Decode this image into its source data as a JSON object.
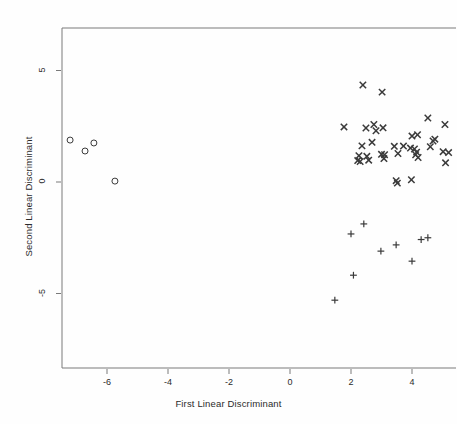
{
  "chart_data": {
    "type": "scatter",
    "title": "",
    "xlabel": "First Linear Discriminant",
    "ylabel": "Second Linear Discriminant",
    "xlim": [
      -7.8,
      5.45
    ],
    "ylim": [
      -7.4,
      6.2
    ],
    "xticks": [
      -6,
      -4,
      -2,
      0,
      2,
      4
    ],
    "xtick_labels": [
      "-6",
      "-4",
      "-2",
      "0",
      "2",
      "4"
    ],
    "yticks": [
      5,
      0,
      -5
    ],
    "ytick_labels": [
      "5",
      "0",
      "-5"
    ],
    "grid": false,
    "legend": "none",
    "marker_color": "#3a3a3a",
    "frame_color": "#7a7a7a",
    "series": [
      {
        "name": "group-circle",
        "marker": "circle",
        "points": [
          [
            -7.21,
            1.88
          ],
          [
            -6.72,
            1.39
          ],
          [
            -6.43,
            1.75
          ],
          [
            -5.74,
            0.04
          ]
        ]
      },
      {
        "name": "group-cross",
        "marker": "x",
        "points": [
          [
            2.39,
            4.35
          ],
          [
            3.02,
            4.03
          ],
          [
            4.52,
            2.87
          ],
          [
            5.08,
            2.58
          ],
          [
            1.77,
            2.47
          ],
          [
            2.49,
            2.42
          ],
          [
            2.75,
            2.58
          ],
          [
            2.82,
            2.3
          ],
          [
            3.05,
            2.43
          ],
          [
            4.0,
            2.06
          ],
          [
            4.18,
            2.12
          ],
          [
            4.69,
            1.84
          ],
          [
            4.75,
            1.92
          ],
          [
            2.36,
            1.62
          ],
          [
            2.69,
            1.78
          ],
          [
            3.42,
            1.6
          ],
          [
            3.72,
            1.61
          ],
          [
            3.95,
            1.52
          ],
          [
            4.08,
            1.48
          ],
          [
            4.15,
            1.34
          ],
          [
            4.6,
            1.58
          ],
          [
            5.02,
            1.36
          ],
          [
            5.2,
            1.32
          ],
          [
            2.26,
            1.18
          ],
          [
            2.52,
            1.15
          ],
          [
            3.0,
            1.24
          ],
          [
            3.1,
            1.22
          ],
          [
            3.54,
            1.28
          ],
          [
            4.12,
            1.22
          ],
          [
            4.2,
            1.1
          ],
          [
            5.1,
            0.86
          ],
          [
            2.22,
            0.96
          ],
          [
            2.3,
            0.92
          ],
          [
            2.58,
            0.98
          ],
          [
            3.08,
            1.05
          ],
          [
            3.48,
            0.06
          ],
          [
            3.52,
            -0.05
          ],
          [
            3.98,
            0.1
          ]
        ]
      },
      {
        "name": "group-plus",
        "marker": "plus",
        "points": [
          [
            2.0,
            -2.33
          ],
          [
            2.42,
            -1.88
          ],
          [
            2.98,
            -3.1
          ],
          [
            3.48,
            -2.82
          ],
          [
            4.3,
            -2.58
          ],
          [
            4.52,
            -2.5
          ],
          [
            4.0,
            -3.55
          ],
          [
            2.08,
            -4.18
          ],
          [
            1.47,
            -5.3
          ]
        ]
      }
    ]
  }
}
